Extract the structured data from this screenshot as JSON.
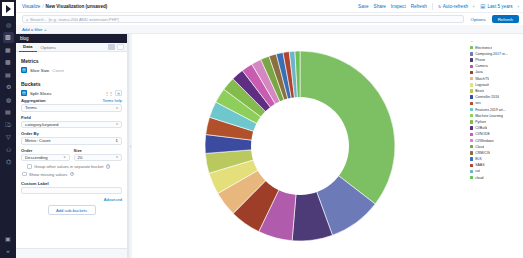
{
  "nav": {
    "logo_name": "kibana-logo",
    "items": [
      {
        "name": "discover",
        "glyph": "◎"
      },
      {
        "name": "visualize",
        "glyph": "▥"
      },
      {
        "name": "dashboard",
        "glyph": "▦"
      },
      {
        "name": "canvas",
        "glyph": "▩"
      },
      {
        "name": "maps",
        "glyph": "▤"
      },
      {
        "name": "machine-learning",
        "glyph": "⚙"
      },
      {
        "name": "infrastructure",
        "glyph": "◍"
      },
      {
        "name": "logs",
        "glyph": "▤"
      },
      {
        "name": "apm",
        "glyph": "⎄"
      },
      {
        "name": "uptime",
        "glyph": "▽"
      },
      {
        "name": "siem",
        "glyph": "⚇"
      },
      {
        "name": "dev-tools",
        "glyph": "⌬"
      }
    ],
    "bottom_items": [
      {
        "name": "management",
        "glyph": "▣"
      },
      {
        "name": "collapse",
        "glyph": "«"
      }
    ]
  },
  "header": {
    "breadcrumb": {
      "root": "Visualize",
      "separator": "/",
      "current": "New Visualization (unsaved)"
    },
    "actions": [
      "Save",
      "Share",
      "Inspect",
      "Refresh"
    ],
    "auto_refresh_label": "Auto-refresh",
    "auto_refresh_icon": "↻",
    "time_picker": {
      "prev_icon": "‹",
      "calendar_icon": "🗓",
      "range_label": "Last 5 years",
      "next_icon": "›"
    }
  },
  "query_bar": {
    "search_icon": "⌕",
    "placeholder": "Search... (e.g. status:200 AND extension:PHP)",
    "options_label": "Options",
    "refresh_label": "Refresh"
  },
  "filter_bar": {
    "add_filter_label": "Add a filter",
    "add_filter_icon": "+"
  },
  "editor": {
    "index_pattern": "blog",
    "index_close_icon": "▸",
    "tabs": [
      {
        "label": "Data",
        "active": true
      },
      {
        "label": "Options",
        "active": false
      }
    ],
    "metrics": {
      "title": "Metrics",
      "agg_icon": "▤",
      "agg_label": "Slice Size",
      "agg_value": "Count"
    },
    "buckets": {
      "title": "Buckets",
      "agg_icon": "▤",
      "agg_label": "Split Slices",
      "remove_icon": "✕",
      "drag_icon": "⋮⋮",
      "aggregation_label": "Aggregation",
      "aggregation_help": "Terms help",
      "aggregation_value": "Terms",
      "field_label": "Field",
      "field_value": "category.keyword",
      "order_by_label": "Order By",
      "order_by_value": "Metric: Count",
      "order_by_metric": "1",
      "order_label": "Order",
      "order_value": "Descending",
      "size_label": "Size",
      "size_value": "20",
      "group_other_label": "Group other values in separate bucket",
      "show_missing_label": "Show missing values",
      "custom_label_title": "Custom Label",
      "custom_label_value": "",
      "advanced_label": "Advanced",
      "add_sub_bucket_label": "Add sub-buckets"
    },
    "caret_icon": "˅",
    "help_icon": "?"
  },
  "legend": {
    "toggle_icon": "⌄",
    "items": [
      {
        "label": "Electronics",
        "color": "#7dc063"
      },
      {
        "label": "Computing 2017 re...",
        "color": "#6c7ab8"
      },
      {
        "label": "Phone",
        "color": "#4d3b77"
      },
      {
        "label": "Camera",
        "color": "#b05bab"
      },
      {
        "label": "Java",
        "color": "#9e3d28"
      },
      {
        "label": "WatchTV",
        "color": "#e8b77d"
      },
      {
        "label": "Logstash",
        "color": "#e4df7a"
      },
      {
        "label": "Beats",
        "color": "#b9c95e"
      },
      {
        "label": "Controller 2016",
        "color": "#3b4ba0"
      },
      {
        "label": "ses",
        "color": "#b1512b"
      },
      {
        "label": "Features 2019 art...",
        "color": "#6ec7cd"
      },
      {
        "label": "Machine Learning",
        "color": "#8ecf5c"
      },
      {
        "label": "Python",
        "color": "#83bb4c"
      },
      {
        "label": "CI/Build",
        "color": "#5f2e82"
      },
      {
        "label": "CI/NODE",
        "color": "#c75cb0"
      },
      {
        "label": "CI/Windows",
        "color": "#d487c1"
      },
      {
        "label": "Cloud",
        "color": "#7aa646"
      },
      {
        "label": "CRM/CIS",
        "color": "#8c6f3f"
      },
      {
        "label": "ELK",
        "color": "#3a6fb5"
      },
      {
        "label": "SAAS",
        "color": "#b0442f"
      },
      {
        "label": "cwl",
        "color": "#6fb3c7"
      },
      {
        "label": "cloud",
        "color": "#6dbf56"
      }
    ]
  },
  "chart_data": {
    "type": "pie",
    "title": "",
    "donut": true,
    "labels": [
      "Electronics",
      "Computing 2017 re...",
      "Phone",
      "Camera",
      "Java",
      "WatchTV",
      "Logstash",
      "Beats",
      "Controller 2016",
      "ses",
      "Features 2019 art...",
      "Machine Learning",
      "Python",
      "CI/Build",
      "CI/NODE",
      "CI/Windows",
      "Cloud",
      "CRM/CIS",
      "ELK",
      "SAAS",
      "cwl",
      "cloud"
    ],
    "values": [
      33.5,
      8.5,
      6.5,
      5.5,
      5.0,
      4.0,
      3.5,
      3.2,
      3.0,
      2.8,
      2.6,
      2.4,
      2.2,
      2.0,
      1.8,
      1.6,
      1.4,
      1.2,
      1.1,
      1.0,
      0.9,
      0.8
    ],
    "colors": [
      "#7dc063",
      "#6c7ab8",
      "#4d3b77",
      "#b05bab",
      "#9e3d28",
      "#e8b77d",
      "#e4df7a",
      "#b9c95e",
      "#3b4ba0",
      "#b1512b",
      "#6ec7cd",
      "#8ecf5c",
      "#83bb4c",
      "#5f2e82",
      "#c75cb0",
      "#d487c1",
      "#7aa646",
      "#8c6f3f",
      "#3a6fb5",
      "#b0442f",
      "#6fb3c7",
      "#6dbf56"
    ],
    "legend_position": "right",
    "inner_radius_ratio": 0.5
  }
}
